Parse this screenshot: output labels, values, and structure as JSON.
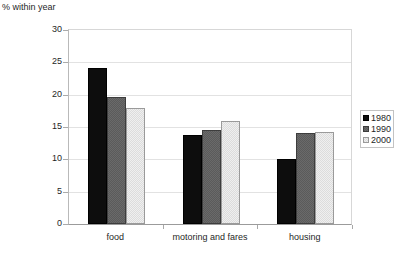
{
  "chart_data": {
    "type": "bar",
    "title": "",
    "ylabel": "% within year",
    "xlabel": "",
    "categories": [
      "food",
      "motoring and fares",
      "housing"
    ],
    "series": [
      {
        "name": "1980",
        "color": "#0d0d0d",
        "values": [
          24.2,
          13.7,
          10.0
        ]
      },
      {
        "name": "1990",
        "color": "#6a6a6a",
        "values": [
          19.7,
          14.5,
          14.0
        ]
      },
      {
        "name": "2000",
        "color": "#efefef",
        "values": [
          18.0,
          16.0,
          14.3
        ]
      }
    ],
    "ylim": [
      0,
      30
    ],
    "yticks": [
      0,
      5,
      10,
      15,
      20,
      25,
      30
    ],
    "ytick_labels": [
      "0",
      "5",
      "10",
      "15",
      "20",
      "25",
      "30"
    ],
    "grid": true,
    "legend_position": "right"
  }
}
